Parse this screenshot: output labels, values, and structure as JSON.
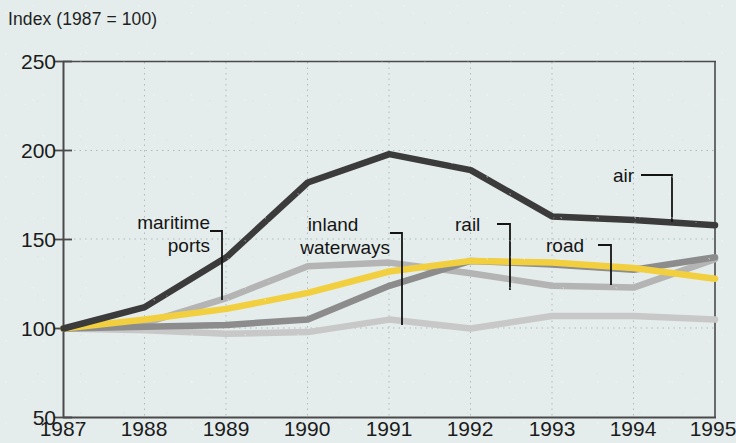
{
  "chart_data": {
    "type": "line",
    "title": "Index (1987 = 100)",
    "xlabel": "",
    "ylabel": "Index (1987 = 100)",
    "x": [
      1987,
      1988,
      1989,
      1990,
      1991,
      1992,
      1993,
      1994,
      1995
    ],
    "xlim": [
      1987,
      1995
    ],
    "ylim": [
      50,
      250
    ],
    "yticks": [
      50,
      100,
      150,
      200,
      250
    ],
    "xticks": [
      "1987",
      "1988",
      "1989",
      "1990",
      "1991",
      "1992",
      "1993",
      "1994",
      "1995"
    ],
    "grid": true,
    "legend": "in-plot annotations with leader lines",
    "series": [
      {
        "name": "air",
        "color": "#3b3b3b",
        "values": [
          100,
          112,
          140,
          182,
          198,
          189,
          163,
          161,
          158
        ]
      },
      {
        "name": "road",
        "color": "#f2cf3f",
        "values": [
          100,
          105,
          111,
          120,
          132,
          138,
          137,
          134,
          128
        ]
      },
      {
        "name": "rail",
        "color": "#8c8c8c",
        "values": [
          100,
          101,
          102,
          105,
          124,
          138,
          136,
          133,
          140
        ]
      },
      {
        "name": "maritime ports",
        "color": "#b4b4b4",
        "values": [
          100,
          103,
          117,
          135,
          137,
          131,
          124,
          123,
          139
        ]
      },
      {
        "name": "inland waterways",
        "color": "#c8c8c8",
        "values": [
          100,
          99,
          97,
          98,
          105,
          100,
          107,
          107,
          105
        ]
      }
    ],
    "annotations": [
      {
        "name": "maritime ports",
        "line1": "maritime",
        "line2": "ports"
      },
      {
        "name": "inland waterways",
        "line1": "inland",
        "line2": "waterways"
      },
      {
        "name": "rail",
        "line1": "rail",
        "line2": ""
      },
      {
        "name": "road",
        "line1": "road",
        "line2": ""
      },
      {
        "name": "air",
        "line1": "air",
        "line2": ""
      }
    ]
  },
  "axes": {
    "y_title": "Index (1987 = 100)",
    "y_labels": [
      "250",
      "200",
      "150",
      "100",
      "50"
    ],
    "x_labels": [
      "1987",
      "1988",
      "1989",
      "1990",
      "1991",
      "1992",
      "1993",
      "1994",
      "1995"
    ]
  },
  "labels": {
    "maritime_l1": "maritime",
    "maritime_l2": "ports",
    "waterways_l1": "inland",
    "waterways_l2": "waterways",
    "rail": "rail",
    "road": "road",
    "air": "air"
  },
  "colors": {
    "background": "#e4edec",
    "axis": "#4a4a4a",
    "grid": "#b9c6c6",
    "air": "#3b3b3b",
    "road": "#f2cf3f",
    "rail": "#8c8c8c",
    "maritime": "#b4b4b4",
    "waterways": "#c8c8c8"
  }
}
